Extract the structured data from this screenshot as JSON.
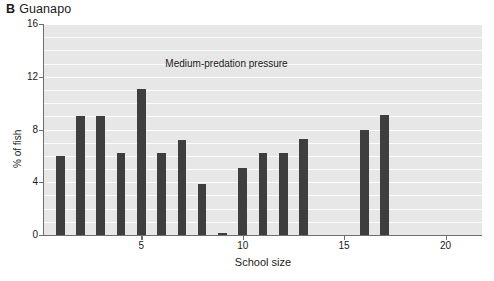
{
  "panel": {
    "letter": "B",
    "name": "Guanapo"
  },
  "annotation": {
    "text": "Medium-predation pressure"
  },
  "chart_data": {
    "type": "bar",
    "xlabel": "School size",
    "ylabel": "% of fish",
    "categories": [
      1,
      2,
      3,
      4,
      5,
      6,
      7,
      8,
      9,
      10,
      11,
      12,
      13,
      16,
      17
    ],
    "values": [
      6.0,
      9.0,
      9.0,
      6.2,
      11.1,
      6.2,
      7.2,
      3.9,
      0.15,
      5.1,
      6.2,
      6.2,
      7.3,
      8.0,
      9.1
    ],
    "series": [
      {
        "name": "% of fish",
        "values": [
          6.0,
          9.0,
          9.0,
          6.2,
          11.1,
          6.2,
          7.2,
          3.9,
          0.15,
          5.1,
          6.2,
          6.2,
          7.3,
          8.0,
          9.1
        ]
      }
    ],
    "xlim": [
      0.2,
      21.8
    ],
    "ylim": [
      0,
      16
    ],
    "ytick_labels": [
      "0",
      "4",
      "8",
      "12",
      "16"
    ],
    "ytick_values": [
      0,
      4,
      8,
      12,
      16
    ],
    "xtick_labels": [
      "5",
      "10",
      "15",
      "20"
    ],
    "xtick_values": [
      5,
      10,
      15,
      20
    ],
    "grid": true,
    "grid_interval": 1,
    "legend": "none",
    "bar_color": "#3e3e3e",
    "plot_background": "#e7e7e7",
    "gridline_color": "#ffffff",
    "annotations": [
      {
        "text": "Medium-predation pressure",
        "x": 9.2,
        "y": 13.0
      }
    ]
  }
}
